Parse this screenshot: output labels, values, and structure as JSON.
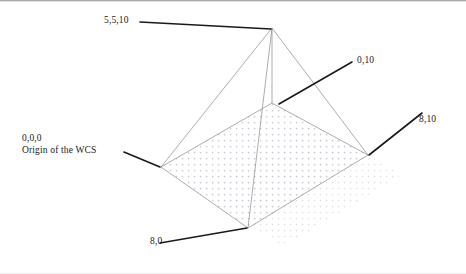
{
  "figure": {
    "background_color": "#ffffff",
    "edge_color": "#8a8a8a",
    "leader_color": "#1a1a1a",
    "shadow_dot_color": "#cfcfd6",
    "width": 466,
    "height": 274
  },
  "labels": {
    "apex": "5,5,10",
    "back": "0,10",
    "right": "8,10",
    "origin_coords": "0,0,0",
    "origin_caption": "Origin of the WCS",
    "front": "8,0"
  },
  "vertices": {
    "apex": {
      "name": "apex",
      "coords": "5,5,10",
      "x": 272,
      "y": 28
    },
    "left_origin": {
      "name": "origin",
      "coords": "0,0,0",
      "x": 161,
      "y": 167
    },
    "back": {
      "name": "back",
      "coords": "0,10",
      "x": 272,
      "y": 103
    },
    "right": {
      "name": "right",
      "coords": "8,10",
      "x": 368,
      "y": 155
    },
    "front": {
      "name": "front",
      "coords": "8,0",
      "x": 248,
      "y": 228
    }
  },
  "leaders": {
    "apex": {
      "x1": 140,
      "y1": 22,
      "x2": 271,
      "y2": 29
    },
    "back": {
      "x1": 279,
      "y1": 104,
      "x2": 352,
      "y2": 62
    },
    "right": {
      "x1": 369,
      "y1": 155,
      "x2": 422,
      "y2": 113
    },
    "origin": {
      "x1": 124,
      "y1": 152,
      "x2": 160,
      "y2": 167
    },
    "front": {
      "x1": 160,
      "y1": 243,
      "x2": 247,
      "y2": 228
    }
  }
}
